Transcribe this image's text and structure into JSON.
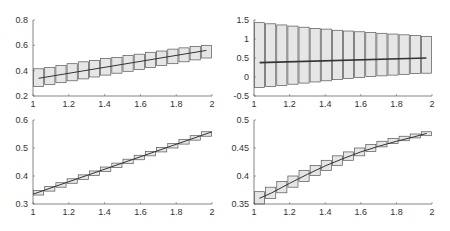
{
  "chart_data": [
    {
      "type": "line",
      "panel": "top-left",
      "title": "",
      "xlabel": "",
      "ylabel": "",
      "xlim": [
        1,
        2
      ],
      "ylim": [
        0.2,
        0.8
      ],
      "xticks": [
        "1",
        "1.2",
        "1.4",
        "1.6",
        "1.8",
        "2"
      ],
      "yticks": [
        "0.2",
        "0.4",
        "0.6",
        "0.8"
      ],
      "grid": false,
      "frame": {
        "x0": 33,
        "x1": 212,
        "y_top": 20,
        "y_bottom": 96
      },
      "series": [
        {
          "name": "mean",
          "x": [
            1.03125,
            1.96875
          ],
          "y": [
            0.34,
            0.56
          ]
        }
      ],
      "boxes": {
        "count": 16,
        "x_start": 1.0,
        "width": 0.0625,
        "lower": [
          0.275,
          0.29,
          0.305,
          0.32,
          0.335,
          0.35,
          0.365,
          0.38,
          0.395,
          0.41,
          0.425,
          0.44,
          0.455,
          0.47,
          0.485,
          0.5
        ],
        "upper": [
          0.415,
          0.425,
          0.44,
          0.455,
          0.47,
          0.48,
          0.495,
          0.505,
          0.52,
          0.53,
          0.545,
          0.555,
          0.57,
          0.58,
          0.59,
          0.6
        ]
      }
    },
    {
      "type": "line",
      "panel": "top-right",
      "title": "",
      "xlabel": "",
      "ylabel": "",
      "xlim": [
        1,
        2
      ],
      "ylim": [
        -0.5,
        1.5
      ],
      "xticks": [
        "1",
        "1.2",
        "1.4",
        "1.6",
        "1.8",
        "2"
      ],
      "yticks": [
        "-0.5",
        "0",
        "0.5",
        "1",
        "1.5"
      ],
      "grid": false,
      "frame": {
        "x0": 254,
        "x1": 432,
        "y_top": 20,
        "y_bottom": 96
      },
      "series": [
        {
          "name": "mean",
          "x": [
            1.03125,
            1.96875
          ],
          "y": [
            0.38,
            0.5
          ]
        }
      ],
      "boxes": {
        "count": 16,
        "x_start": 1.0,
        "width": 0.0625,
        "lower": [
          -0.28,
          -0.25,
          -0.22,
          -0.19,
          -0.16,
          -0.13,
          -0.1,
          -0.07,
          -0.04,
          -0.01,
          0.01,
          0.03,
          0.05,
          0.07,
          0.09,
          0.1
        ],
        "upper": [
          1.43,
          1.4,
          1.37,
          1.34,
          1.31,
          1.28,
          1.26,
          1.23,
          1.21,
          1.19,
          1.17,
          1.15,
          1.13,
          1.11,
          1.09,
          1.07
        ]
      }
    },
    {
      "type": "line",
      "panel": "bottom-left",
      "title": "",
      "xlabel": "",
      "ylabel": "",
      "xlim": [
        1,
        2
      ],
      "ylim": [
        0.3,
        0.6
      ],
      "xticks": [
        "1",
        "1.2",
        "1.4",
        "1.6",
        "1.8",
        "2"
      ],
      "yticks": [
        "0.3",
        "0.4",
        "0.5",
        "0.6"
      ],
      "grid": false,
      "frame": {
        "x0": 33,
        "x1": 212,
        "y_top": 120,
        "y_bottom": 204
      },
      "series": [
        {
          "name": "mean",
          "x": [
            1.0,
            2.0
          ],
          "y": [
            0.335,
            0.558
          ]
        }
      ],
      "boxes": {
        "count": 16,
        "x_start": 1.0,
        "width": 0.0625,
        "lower": [
          0.332,
          0.346,
          0.36,
          0.374,
          0.388,
          0.402,
          0.416,
          0.43,
          0.444,
          0.458,
          0.472,
          0.486,
          0.5,
          0.514,
          0.528,
          0.542
        ],
        "upper": [
          0.348,
          0.362,
          0.376,
          0.39,
          0.404,
          0.418,
          0.432,
          0.446,
          0.46,
          0.474,
          0.488,
          0.502,
          0.516,
          0.53,
          0.544,
          0.558
        ]
      }
    },
    {
      "type": "line",
      "panel": "bottom-right",
      "title": "",
      "xlabel": "",
      "ylabel": "",
      "xlim": [
        1,
        2
      ],
      "ylim": [
        0.35,
        0.5
      ],
      "xticks": [
        "1",
        "1.2",
        "1.4",
        "1.6",
        "1.8",
        "2"
      ],
      "yticks": [
        "0.35",
        "0.4",
        "0.45",
        "0.5"
      ],
      "grid": false,
      "frame": {
        "x0": 254,
        "x1": 432,
        "y_top": 120,
        "y_bottom": 204
      },
      "series": [
        {
          "name": "mean",
          "x": [
            1.03,
            1.1,
            1.2,
            1.3,
            1.4,
            1.5,
            1.6,
            1.7,
            1.8,
            1.9,
            1.97
          ],
          "y": [
            0.36,
            0.37,
            0.387,
            0.403,
            0.418,
            0.431,
            0.443,
            0.453,
            0.462,
            0.47,
            0.476
          ]
        }
      ],
      "boxes": {
        "count": 16,
        "x_start": 1.0,
        "width": 0.0625,
        "lower": [
          0.35,
          0.36,
          0.37,
          0.38,
          0.39,
          0.401,
          0.41,
          0.419,
          0.428,
          0.436,
          0.444,
          0.452,
          0.458,
          0.463,
          0.468,
          0.472
        ],
        "upper": [
          0.372,
          0.38,
          0.39,
          0.4,
          0.41,
          0.419,
          0.428,
          0.436,
          0.443,
          0.45,
          0.456,
          0.462,
          0.467,
          0.471,
          0.475,
          0.479
        ]
      }
    }
  ],
  "style": {
    "box_fill": "#e6e6e6",
    "box_stroke": "#555555",
    "line_color": "#333333",
    "axis_color": "#666666",
    "tick_text_color": "#333333"
  }
}
